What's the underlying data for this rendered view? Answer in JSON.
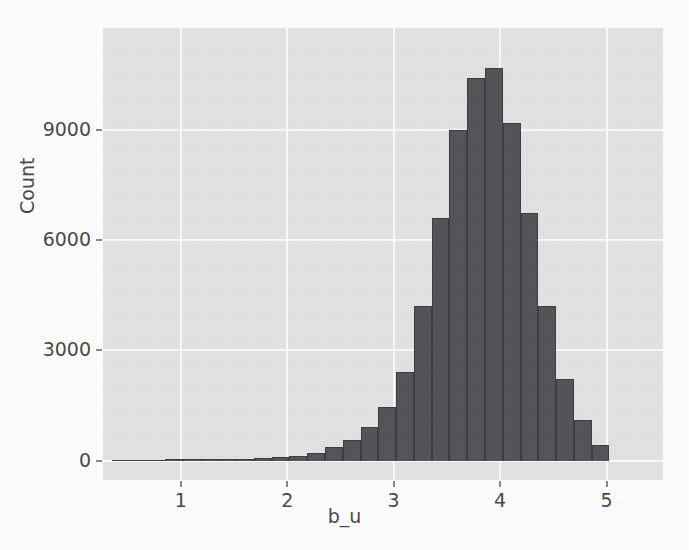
{
  "chart_data": {
    "type": "bar",
    "title": "",
    "subtitle": "",
    "xlabel": "b_u",
    "ylabel": "Count",
    "xlim": [
      0.27,
      5.53
    ],
    "ylim": [
      -530,
      11790
    ],
    "xticks": [
      1,
      2,
      3,
      4,
      5
    ],
    "xticklabels": [
      "1",
      "2",
      "3",
      "4",
      "5"
    ],
    "yticks": [
      0,
      3000,
      6000,
      9000
    ],
    "yticklabels": [
      "0",
      "3000",
      "6000",
      "9000"
    ],
    "grid": true,
    "legend": null,
    "bin_width": 0.167,
    "bin_centers": [
      0.435,
      0.602,
      0.769,
      0.936,
      1.103,
      1.27,
      1.437,
      1.604,
      1.771,
      1.938,
      2.105,
      2.272,
      2.439,
      2.606,
      2.773,
      2.94,
      3.107,
      3.274,
      3.441,
      3.608,
      3.775,
      3.942,
      4.109,
      4.276,
      4.443,
      4.61,
      4.777,
      4.944
    ],
    "values": [
      20,
      20,
      25,
      30,
      35,
      40,
      45,
      55,
      70,
      95,
      130,
      215,
      360,
      560,
      910,
      1460,
      2420,
      4210,
      6620,
      9010,
      10420,
      10710,
      9210,
      6760,
      4210,
      2210,
      1110,
      430
    ],
    "colors": {
      "bar_face": "#56565a",
      "bar_edge": "#3f3f43",
      "plot_background": "#e4e4e4",
      "grid": "#fbfbfb",
      "figure_background": "#ffffff",
      "text": "#4b4b4b"
    }
  }
}
